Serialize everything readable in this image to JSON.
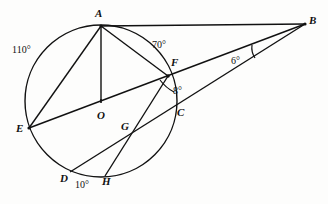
{
  "figure": {
    "kind": "circle-geometry-diagram",
    "background_color": "#fdfdfc",
    "stroke_color": "#111111",
    "canvas": {
      "width": 328,
      "height": 204
    },
    "circle": {
      "cx": 101,
      "cy": 101,
      "r": 76
    },
    "points": [
      {
        "id": "A",
        "label": "A",
        "x": 101,
        "y": 26,
        "label_x": 95,
        "label_y": 8
      },
      {
        "id": "B",
        "label": "B",
        "x": 305,
        "y": 24,
        "label_x": 309,
        "label_y": 15
      },
      {
        "id": "C",
        "label": "C",
        "x": 174,
        "y": 117,
        "label_x": 177,
        "label_y": 107
      },
      {
        "id": "D",
        "label": "D",
        "x": 70,
        "y": 172,
        "label_x": 60,
        "label_y": 173
      },
      {
        "id": "E",
        "label": "E",
        "x": 29,
        "y": 128,
        "label_x": 16,
        "label_y": 123
      },
      {
        "id": "F",
        "label": "F",
        "x": 168,
        "y": 76,
        "label_x": 171,
        "label_y": 57
      },
      {
        "id": "G",
        "label": "G",
        "x": 133,
        "y": 134,
        "label_x": 121,
        "label_y": 121
      },
      {
        "id": "H",
        "label": "H",
        "x": 105,
        "y": 176,
        "label_x": 102,
        "label_y": 176
      },
      {
        "id": "O",
        "label": "O",
        "x": 101,
        "y": 101,
        "label_x": 97,
        "label_y": 110
      }
    ],
    "segments": [
      {
        "name": "chord-a-e",
        "from": "A",
        "to": "E"
      },
      {
        "name": "radius-a-o",
        "from": "A",
        "to": "O"
      },
      {
        "name": "chord-a-f",
        "from": "A",
        "to": "F"
      },
      {
        "name": "line-a-b",
        "from": "A",
        "to": "B"
      },
      {
        "name": "line-e-f-b",
        "from": "E",
        "to": "B"
      },
      {
        "name": "line-d-c-b",
        "from": "D",
        "to": "B"
      },
      {
        "name": "chord-f-h",
        "from": "F",
        "to": "H"
      }
    ],
    "angle_labels": [
      {
        "name": "arc-110",
        "text": "110°",
        "x": 12,
        "y": 45
      },
      {
        "name": "arc-70",
        "text": "70°",
        "x": 152,
        "y": 40
      },
      {
        "name": "angle-6",
        "text": "6°",
        "x": 231,
        "y": 56
      },
      {
        "name": "angle-8",
        "text": "8°",
        "x": 173,
        "y": 86
      },
      {
        "name": "arc-10",
        "text": "10°",
        "x": 75,
        "y": 180
      }
    ],
    "angle_marks": [
      {
        "name": "right-angle-mark-at-o",
        "type": "tick"
      },
      {
        "name": "angle-arc-at-b",
        "type": "arc"
      },
      {
        "name": "angle-arc-at-f",
        "type": "arc"
      }
    ]
  }
}
